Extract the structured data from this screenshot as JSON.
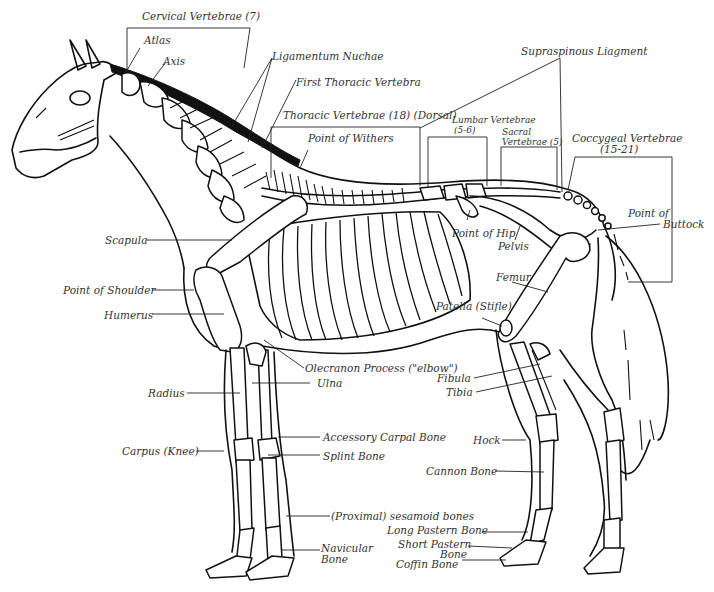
{
  "diagram": {
    "labels": {
      "cervical_vertebrae": "Cervical Vertebrae (7)",
      "atlas": "Atlas",
      "axis": "Axis",
      "ligamentum_nuchae": "Ligamentum Nuchae",
      "first_thoracic_vertebra": "First Thoracic Vertebra",
      "thoracic_vertebrae": "Thoracic Vertebrae (18) (Dorsal)",
      "point_of_withers": "Point of Withers",
      "supraspinous_ligament": "Supraspinous Liagment",
      "lumbar_vertebrae_1": "Lumbar Vertebrae",
      "lumbar_vertebrae_2": "(5-6)",
      "sacral_vertebrae_1": "Sacral",
      "sacral_vertebrae_2": "Vertebrae (5)",
      "coccygeal_vertebrae_1": "Coccygeal Vertebrae",
      "coccygeal_vertebrae_2": "(15-21)",
      "point_of_buttock_1": "Point of",
      "point_of_buttock_2": "Buttock",
      "point_of_hip": "Point of Hip",
      "pelvis": "Pelvis",
      "femur": "Femur",
      "patella": "Patella (Stifle)",
      "scapula": "Scapula",
      "point_of_shoulder": "Point of Shoulder",
      "humerus": "Humerus",
      "olecranon_process": "Olecranon Process (\"elbow\")",
      "ulna": "Ulna",
      "radius": "Radius",
      "fibula": "Fibula",
      "tibia": "Tibia",
      "carpus": "Carpus (Knee)",
      "accessory_carpal_bone": "Accessory Carpal Bone",
      "splint_bone": "Splint Bone",
      "hock": "Hock",
      "cannon_bone": "Cannon Bone",
      "sesamoid_bones": "(Proximal) sesamoid bones",
      "long_pastern_bone": "Long Pastern Bone",
      "short_pastern_bone_1": "Short Pastern",
      "short_pastern_bone_2": "Bone",
      "navicular_bone_1": "Navicular",
      "navicular_bone_2": "Bone",
      "coffin_bone": "Coffin Bone"
    }
  }
}
